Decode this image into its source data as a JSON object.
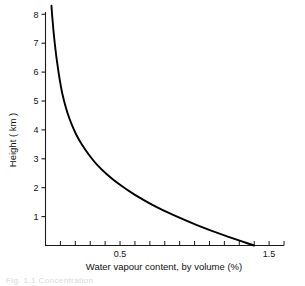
{
  "figure": {
    "background": "#ffffff",
    "line_color": "#000000",
    "axis_color": "#1a1a1a",
    "caption_partial": "Fig. 1.1  Concentration"
  },
  "axes": {
    "x": {
      "title": "Water vapour content, by volume (%)",
      "labeled_ticks": [
        {
          "value": 0.5,
          "label": "0.5"
        },
        {
          "value": 1.5,
          "label": "1.5"
        }
      ],
      "minor_tick_step": 0.1,
      "range": [
        0.0,
        1.6
      ]
    },
    "y": {
      "title": "Height ( km )",
      "labeled_ticks": [
        {
          "value": 8,
          "label": "8"
        },
        {
          "value": 7,
          "label": "7"
        },
        {
          "value": 6,
          "label": "6"
        },
        {
          "value": 5,
          "label": "5"
        },
        {
          "value": 4,
          "label": "4"
        },
        {
          "value": 3,
          "label": "3"
        },
        {
          "value": 2,
          "label": "2"
        },
        {
          "value": 1,
          "label": "1"
        }
      ],
      "range": [
        0,
        8.6
      ]
    }
  },
  "chart_data": {
    "type": "line",
    "title": "",
    "subtitle": "",
    "xlabel": "Water vapour content, by volume (%)",
    "ylabel": "Height ( km )",
    "xlim": [
      0.0,
      1.6
    ],
    "ylim": [
      0.0,
      8.6
    ],
    "grid": false,
    "legend": false,
    "legend_position": "none",
    "x_tick_labels": [
      "0.5",
      "1.5"
    ],
    "x_tick_values": [
      0.5,
      1.5
    ],
    "y_tick_labels": [
      "1",
      "2",
      "3",
      "4",
      "5",
      "6",
      "7",
      "8"
    ],
    "y_tick_values": [
      1,
      2,
      3,
      4,
      5,
      6,
      7,
      8
    ],
    "x_minor_tick_step": 0.1,
    "series": [
      {
        "name": "Water vapour profile",
        "x_label": "Water vapour content, by volume (%)",
        "y_label": "Height (km)",
        "x": [
          1.4,
          1.2,
          1.02,
          0.86,
          0.72,
          0.6,
          0.5,
          0.415,
          0.345,
          0.29,
          0.243,
          0.205,
          0.175,
          0.15,
          0.13,
          0.113,
          0.1,
          0.089,
          0.079,
          0.07,
          0.062,
          0.055,
          0.049,
          0.044,
          0.04
        ],
        "y": [
          0.0,
          0.35,
          0.7,
          1.05,
          1.4,
          1.75,
          2.1,
          2.45,
          2.8,
          3.15,
          3.5,
          3.85,
          4.2,
          4.55,
          4.9,
          5.25,
          5.6,
          5.95,
          6.3,
          6.65,
          7.0,
          7.35,
          7.7,
          8.0,
          8.3
        ]
      }
    ],
    "annotations": [
      {
        "text": "curve descends monotonically from 1.4% at 0 km to about 0.04% at 8.3 km"
      }
    ]
  }
}
